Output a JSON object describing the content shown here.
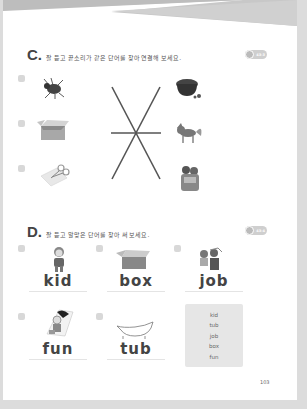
{
  "section_c": {
    "letter": "C.",
    "instruction": "잘 듣고 끝소리가 같은 단어를 찾아 연결해 보세요.",
    "audio_badge": "43-3",
    "items_left": [
      {
        "number": "1",
        "image": "bug-icon"
      },
      {
        "number": "2",
        "image": "box-icon"
      },
      {
        "number": "3",
        "image": "cut-icon"
      }
    ],
    "items_right": [
      {
        "image": "pot-icon"
      },
      {
        "image": "fox-icon"
      },
      {
        "image": "hug-icon"
      }
    ],
    "lines": [
      {
        "from": "left-1",
        "to": "right-3"
      },
      {
        "from": "left-2",
        "to": "right-2"
      },
      {
        "from": "left-3",
        "to": "right-1"
      }
    ]
  },
  "section_d": {
    "letter": "D.",
    "instruction": "잘 듣고 알맞은 단어를 찾아 써 보세요.",
    "audio_badge": "43-4",
    "cards": [
      {
        "number": "1",
        "image": "kid-icon",
        "word": "kid"
      },
      {
        "number": "2",
        "image": "box-icon",
        "word": "box"
      },
      {
        "number": "3",
        "image": "job-icon",
        "word": "job"
      },
      {
        "number": "4",
        "image": "fun-icon",
        "word": "fun"
      },
      {
        "number": "5",
        "image": "tub-icon",
        "word": "tub"
      }
    ],
    "word_bank": [
      "kid",
      "tub",
      "job",
      "box",
      "fun"
    ]
  },
  "page_number": "103",
  "colors": {
    "line": "#555555",
    "badge": "#cfcfcf",
    "wordbox": "#e6e6e6"
  }
}
